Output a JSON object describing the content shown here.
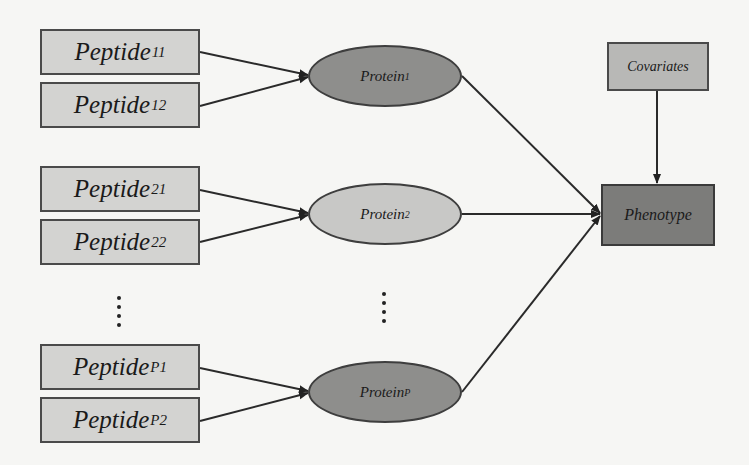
{
  "diagram": {
    "peptides": [
      {
        "base": "Peptide",
        "sub": "11"
      },
      {
        "base": "Peptide",
        "sub": "12"
      },
      {
        "base": "Peptide",
        "sub": "21"
      },
      {
        "base": "Peptide",
        "sub": "22"
      },
      {
        "base": "Peptide",
        "sub": "P1"
      },
      {
        "base": "Peptide",
        "sub": "P2"
      }
    ],
    "proteins": [
      {
        "base": "Protein",
        "sub": "1"
      },
      {
        "base": "Protein",
        "sub": "2"
      },
      {
        "base": "Protein",
        "sub": "P"
      }
    ],
    "covariates": "Covariates",
    "phenotype": "Phenotype",
    "ellipsis": "⋮",
    "edges": [
      [
        "Peptide11",
        "Protein1"
      ],
      [
        "Peptide12",
        "Protein1"
      ],
      [
        "Peptide21",
        "Protein2"
      ],
      [
        "Peptide22",
        "Protein2"
      ],
      [
        "PeptideP1",
        "ProteinP"
      ],
      [
        "PeptideP2",
        "ProteinP"
      ],
      [
        "Protein1",
        "Phenotype"
      ],
      [
        "Protein2",
        "Phenotype"
      ],
      [
        "ProteinP",
        "Phenotype"
      ],
      [
        "Covariates",
        "Phenotype"
      ]
    ]
  }
}
